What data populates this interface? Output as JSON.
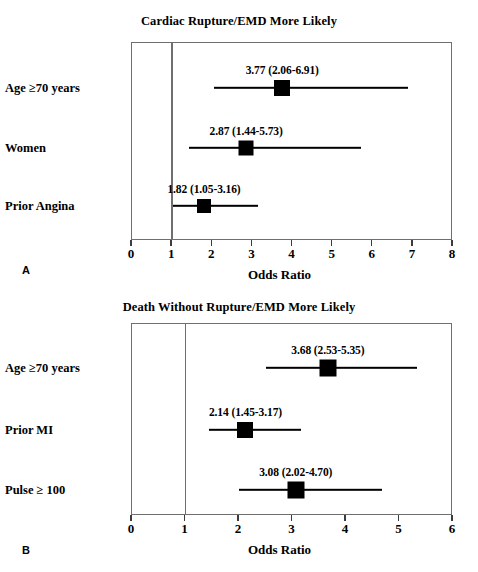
{
  "figure": {
    "axis_title": "Odds Ratio",
    "panel_a_letter": "A",
    "panel_b_letter": "B"
  },
  "chart_data": [
    {
      "type": "forest",
      "panel": "A",
      "title": "Cardiac Rupture/EMD More Likely",
      "xlabel": "Odds Ratio",
      "ylabel": "",
      "xlim": [
        0,
        8
      ],
      "xticks": [
        0,
        1,
        2,
        3,
        4,
        5,
        6,
        7,
        8
      ],
      "xtick_labels": [
        "0",
        "1",
        "2",
        "3",
        "4",
        "5",
        "6",
        "7",
        "8"
      ],
      "reference_line": 1,
      "grid": false,
      "legend": "none",
      "categories": [
        "Age ≥70 years",
        "Women",
        "Prior Angina"
      ],
      "points": [
        {
          "label": "Age ≥70 years",
          "odds_ratio": 3.77,
          "ci_low": 2.06,
          "ci_high": 6.91,
          "annotation": "3.77 (2.06-6.91)",
          "marker_size": 16
        },
        {
          "label": "Women",
          "odds_ratio": 2.87,
          "ci_low": 1.44,
          "ci_high": 5.73,
          "annotation": "2.87 (1.44-5.73)",
          "marker_size": 15
        },
        {
          "label": "Prior Angina",
          "odds_ratio": 1.82,
          "ci_low": 1.05,
          "ci_high": 3.16,
          "annotation": "1.82 (1.05-3.16)",
          "marker_size": 14
        }
      ]
    },
    {
      "type": "forest",
      "panel": "B",
      "title": "Death Without Rupture/EMD More Likely",
      "xlabel": "Odds Ratio",
      "ylabel": "",
      "xlim": [
        0,
        6
      ],
      "xticks": [
        0,
        1,
        2,
        3,
        4,
        5,
        6
      ],
      "xtick_labels": [
        "0",
        "1",
        "2",
        "3",
        "4",
        "5",
        "6"
      ],
      "reference_line": 1,
      "grid": false,
      "legend": "none",
      "categories": [
        "Age ≥70 years",
        "Prior MI",
        "Pulse ≥ 100"
      ],
      "points": [
        {
          "label": "Age ≥70 years",
          "odds_ratio": 3.68,
          "ci_low": 2.53,
          "ci_high": 5.35,
          "annotation": "3.68 (2.53-5.35)",
          "marker_size": 17
        },
        {
          "label": "Prior MI",
          "odds_ratio": 2.14,
          "ci_low": 1.45,
          "ci_high": 3.17,
          "annotation": "2.14 (1.45-3.17)",
          "marker_size": 16
        },
        {
          "label": "Pulse ≥ 100",
          "odds_ratio": 3.08,
          "ci_low": 2.02,
          "ci_high": 4.7,
          "annotation": "3.08 (2.02-4.70)",
          "marker_size": 17
        }
      ]
    }
  ]
}
